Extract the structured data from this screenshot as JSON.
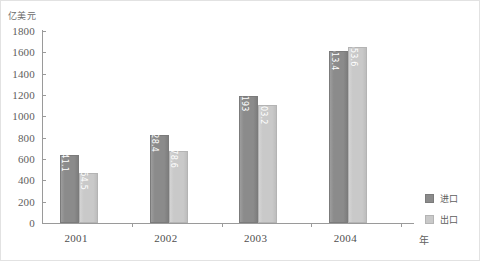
{
  "chart_data": {
    "type": "bar",
    "title": "",
    "subtitle": "",
    "xlabel": "年",
    "ylabel": "亿美元",
    "categories": [
      "2001",
      "2002",
      "2003",
      "2004"
    ],
    "series": [
      {
        "name": "进口",
        "color": "#8b8b8b",
        "values": [
          641.1,
          828.4,
          1193,
          1613.4
        ],
        "labels": [
          "641.1",
          "828.4",
          "1193",
          "1613.4"
        ]
      },
      {
        "name": "出口",
        "color": "#c9c9c9",
        "values": [
          464.5,
          678.6,
          1103.2,
          1653.6
        ],
        "labels": [
          "464.5",
          "678.6",
          "1103.2",
          "1653.6"
        ]
      }
    ],
    "ylim": [
      0,
      1800
    ],
    "yticks": [
      0,
      200,
      400,
      600,
      800,
      1000,
      1200,
      1400,
      1600,
      1800
    ],
    "ytick_labels": [
      "0",
      "200",
      "400",
      "600",
      "800",
      "1000",
      "1200",
      "1400",
      "1600",
      "1800"
    ],
    "grid": false,
    "legend_position": "right",
    "data_labels": true,
    "data_label_orientation": "vertical"
  },
  "axes": {
    "y_unit_caption": "亿美元",
    "x_unit_caption": "年"
  },
  "legend": {
    "entries": [
      {
        "label": "进口",
        "color": "#8b8b8b"
      },
      {
        "label": "出口",
        "color": "#c9c9c9"
      }
    ]
  },
  "colors": {
    "imports": "#8b8b8b",
    "exports": "#c9c9c9",
    "axis": "#9a9a9a",
    "text": "#5e5e5e",
    "background": "#ffffff"
  }
}
